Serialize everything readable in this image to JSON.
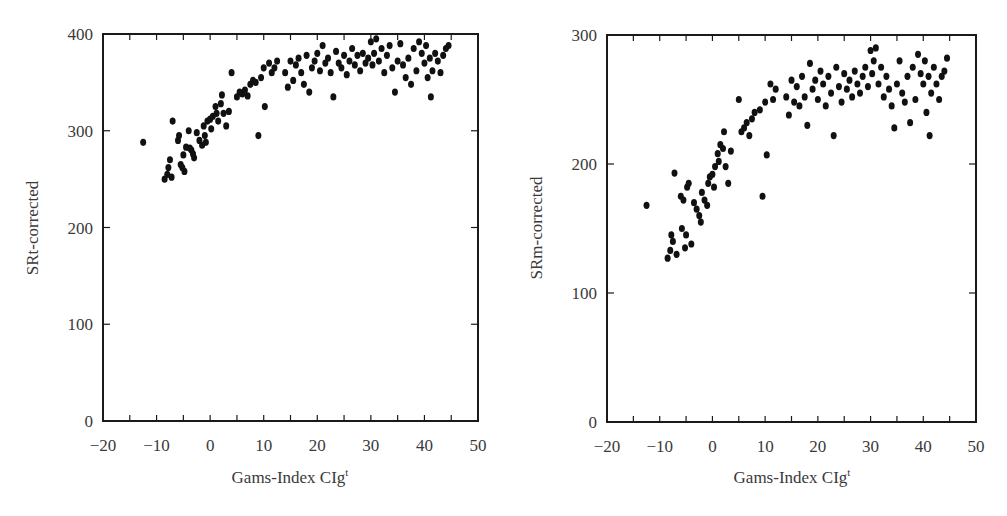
{
  "chart_data": [
    {
      "type": "scatter",
      "title": "",
      "xlabel": "Gams-Index CIg",
      "xlabel_superscript": "t",
      "ylabel": "SRt-corrected",
      "xlim": [
        -20,
        50
      ],
      "ylim": [
        0,
        400
      ],
      "xticks": [
        -20,
        -10,
        0,
        10,
        20,
        30,
        40,
        50
      ],
      "xminor": [
        -15,
        -5,
        5,
        15,
        25,
        35,
        45
      ],
      "yticks": [
        0,
        100,
        200,
        300,
        400
      ],
      "grid": false,
      "legend": null,
      "points": [
        [
          -12.5,
          288
        ],
        [
          -8.5,
          250
        ],
        [
          -8.0,
          255
        ],
        [
          -7.8,
          262
        ],
        [
          -7.5,
          270
        ],
        [
          -7.2,
          252
        ],
        [
          -7.0,
          310
        ],
        [
          -6.0,
          290
        ],
        [
          -5.8,
          295
        ],
        [
          -5.5,
          265
        ],
        [
          -5.2,
          262
        ],
        [
          -5.0,
          275
        ],
        [
          -4.8,
          258
        ],
        [
          -4.5,
          283
        ],
        [
          -4.0,
          300
        ],
        [
          -3.8,
          282
        ],
        [
          -3.5,
          280
        ],
        [
          -3.2,
          276
        ],
        [
          -3.0,
          272
        ],
        [
          -2.5,
          298
        ],
        [
          -2.0,
          290
        ],
        [
          -1.5,
          285
        ],
        [
          -1.2,
          305
        ],
        [
          -1.0,
          295
        ],
        [
          -0.8,
          288
        ],
        [
          -0.5,
          310
        ],
        [
          0.0,
          312
        ],
        [
          0.2,
          302
        ],
        [
          0.5,
          315
        ],
        [
          1.0,
          325
        ],
        [
          1.2,
          318
        ],
        [
          1.5,
          310
        ],
        [
          2.0,
          328
        ],
        [
          2.2,
          337
        ],
        [
          2.5,
          318
        ],
        [
          3.0,
          305
        ],
        [
          3.5,
          320
        ],
        [
          4.0,
          360
        ],
        [
          5.0,
          335
        ],
        [
          5.5,
          340
        ],
        [
          6.0,
          338
        ],
        [
          6.5,
          342
        ],
        [
          7.0,
          336
        ],
        [
          7.5,
          348
        ],
        [
          8.0,
          352
        ],
        [
          8.5,
          350
        ],
        [
          9.0,
          295
        ],
        [
          9.5,
          355
        ],
        [
          10.0,
          365
        ],
        [
          10.2,
          325
        ],
        [
          11.0,
          370
        ],
        [
          11.5,
          360
        ],
        [
          12.0,
          365
        ],
        [
          12.5,
          372
        ],
        [
          14.0,
          360
        ],
        [
          14.5,
          345
        ],
        [
          15.0,
          372
        ],
        [
          15.5,
          352
        ],
        [
          16.0,
          368
        ],
        [
          16.5,
          375
        ],
        [
          17.0,
          360
        ],
        [
          17.5,
          348
        ],
        [
          18.0,
          378
        ],
        [
          18.5,
          340
        ],
        [
          19.0,
          365
        ],
        [
          19.5,
          372
        ],
        [
          20.0,
          380
        ],
        [
          20.5,
          362
        ],
        [
          21.0,
          388
        ],
        [
          21.5,
          370
        ],
        [
          22.0,
          375
        ],
        [
          22.5,
          360
        ],
        [
          23.0,
          335
        ],
        [
          23.5,
          382
        ],
        [
          24.0,
          370
        ],
        [
          24.5,
          365
        ],
        [
          25.0,
          378
        ],
        [
          25.5,
          358
        ],
        [
          26.0,
          372
        ],
        [
          26.5,
          385
        ],
        [
          27.0,
          368
        ],
        [
          27.5,
          378
        ],
        [
          28.0,
          362
        ],
        [
          28.5,
          380
        ],
        [
          29.0,
          370
        ],
        [
          29.5,
          375
        ],
        [
          30.0,
          392
        ],
        [
          30.3,
          368
        ],
        [
          30.6,
          380
        ],
        [
          31.0,
          395
        ],
        [
          31.5,
          372
        ],
        [
          32.0,
          385
        ],
        [
          32.5,
          360
        ],
        [
          33.0,
          378
        ],
        [
          33.5,
          388
        ],
        [
          34.0,
          365
        ],
        [
          34.5,
          340
        ],
        [
          35.0,
          372
        ],
        [
          35.5,
          390
        ],
        [
          36.0,
          368
        ],
        [
          36.5,
          355
        ],
        [
          37.0,
          375
        ],
        [
          37.5,
          348
        ],
        [
          38.0,
          385
        ],
        [
          38.5,
          362
        ],
        [
          39.0,
          392
        ],
        [
          39.5,
          380
        ],
        [
          40.0,
          370
        ],
        [
          40.3,
          388
        ],
        [
          40.6,
          355
        ],
        [
          41.0,
          375
        ],
        [
          41.2,
          335
        ],
        [
          41.5,
          362
        ],
        [
          42.0,
          380
        ],
        [
          42.5,
          372
        ],
        [
          43.0,
          360
        ],
        [
          43.5,
          378
        ],
        [
          44.0,
          385
        ],
        [
          44.5,
          388
        ]
      ]
    },
    {
      "type": "scatter",
      "title": "",
      "xlabel": "Gams-Index CIg",
      "xlabel_superscript": "t",
      "ylabel": "SRm-corrected",
      "xlim": [
        -20,
        50
      ],
      "ylim": [
        0,
        300
      ],
      "xticks": [
        -20,
        -10,
        0,
        10,
        20,
        30,
        40,
        50
      ],
      "xminor": [
        -15,
        -5,
        5,
        15,
        25,
        35,
        45
      ],
      "yticks": [
        0,
        100,
        200,
        300
      ],
      "grid": false,
      "legend": null,
      "points": [
        [
          -12.5,
          168
        ],
        [
          -8.5,
          127
        ],
        [
          -8.0,
          133
        ],
        [
          -7.8,
          145
        ],
        [
          -7.5,
          140
        ],
        [
          -7.2,
          193
        ],
        [
          -6.8,
          130
        ],
        [
          -6.0,
          175
        ],
        [
          -5.8,
          150
        ],
        [
          -5.5,
          172
        ],
        [
          -5.2,
          135
        ],
        [
          -5.0,
          145
        ],
        [
          -4.8,
          182
        ],
        [
          -4.5,
          185
        ],
        [
          -4.0,
          138
        ],
        [
          -3.5,
          170
        ],
        [
          -3.0,
          165
        ],
        [
          -2.5,
          160
        ],
        [
          -2.2,
          155
        ],
        [
          -2.0,
          178
        ],
        [
          -1.5,
          172
        ],
        [
          -1.0,
          168
        ],
        [
          -0.8,
          185
        ],
        [
          -0.5,
          190
        ],
        [
          0.0,
          192
        ],
        [
          0.3,
          182
        ],
        [
          0.5,
          198
        ],
        [
          1.0,
          208
        ],
        [
          1.2,
          202
        ],
        [
          1.5,
          215
        ],
        [
          2.0,
          212
        ],
        [
          2.2,
          225
        ],
        [
          2.5,
          198
        ],
        [
          3.0,
          185
        ],
        [
          3.5,
          210
        ],
        [
          5.0,
          250
        ],
        [
          5.5,
          225
        ],
        [
          6.0,
          228
        ],
        [
          6.5,
          232
        ],
        [
          7.0,
          222
        ],
        [
          7.5,
          235
        ],
        [
          8.0,
          240
        ],
        [
          9.0,
          242
        ],
        [
          9.5,
          175
        ],
        [
          10.0,
          248
        ],
        [
          10.3,
          207
        ],
        [
          11.0,
          262
        ],
        [
          11.5,
          250
        ],
        [
          12.0,
          258
        ],
        [
          14.0,
          252
        ],
        [
          14.5,
          238
        ],
        [
          15.0,
          265
        ],
        [
          15.5,
          248
        ],
        [
          16.0,
          260
        ],
        [
          16.5,
          245
        ],
        [
          17.0,
          268
        ],
        [
          17.5,
          252
        ],
        [
          18.0,
          230
        ],
        [
          18.5,
          278
        ],
        [
          19.0,
          258
        ],
        [
          19.5,
          265
        ],
        [
          20.0,
          250
        ],
        [
          20.5,
          272
        ],
        [
          21.0,
          262
        ],
        [
          21.5,
          245
        ],
        [
          22.0,
          268
        ],
        [
          22.5,
          255
        ],
        [
          23.0,
          222
        ],
        [
          23.5,
          275
        ],
        [
          24.0,
          260
        ],
        [
          24.5,
          248
        ],
        [
          25.0,
          270
        ],
        [
          25.5,
          258
        ],
        [
          26.0,
          265
        ],
        [
          26.5,
          252
        ],
        [
          27.0,
          272
        ],
        [
          27.5,
          262
        ],
        [
          28.0,
          255
        ],
        [
          28.5,
          268
        ],
        [
          29.0,
          275
        ],
        [
          29.5,
          260
        ],
        [
          30.0,
          288
        ],
        [
          30.3,
          270
        ],
        [
          30.6,
          280
        ],
        [
          31.0,
          290
        ],
        [
          31.5,
          262
        ],
        [
          32.0,
          275
        ],
        [
          32.5,
          252
        ],
        [
          33.0,
          268
        ],
        [
          33.5,
          258
        ],
        [
          34.0,
          245
        ],
        [
          34.5,
          228
        ],
        [
          35.0,
          262
        ],
        [
          35.5,
          280
        ],
        [
          36.0,
          255
        ],
        [
          36.5,
          248
        ],
        [
          37.0,
          268
        ],
        [
          37.5,
          232
        ],
        [
          38.0,
          275
        ],
        [
          38.5,
          250
        ],
        [
          39.0,
          285
        ],
        [
          39.5,
          270
        ],
        [
          40.0,
          262
        ],
        [
          40.3,
          280
        ],
        [
          40.6,
          240
        ],
        [
          41.0,
          268
        ],
        [
          41.2,
          222
        ],
        [
          41.5,
          255
        ],
        [
          42.0,
          275
        ],
        [
          42.5,
          262
        ],
        [
          43.0,
          250
        ],
        [
          43.5,
          268
        ],
        [
          44.0,
          272
        ],
        [
          44.5,
          282
        ]
      ]
    }
  ],
  "plots": {
    "left": {
      "ylabel": "SRt-corrected",
      "xlabel": "Gams-Index CIg",
      "xlabel_sup": "t",
      "ytick_labels": [
        "0",
        "100",
        "200",
        "300",
        "400"
      ],
      "xtick_labels": [
        "−20",
        "−10",
        "0",
        "10",
        "20",
        "30",
        "40",
        "50"
      ]
    },
    "right": {
      "ylabel": "SRm-corrected",
      "xlabel": "Gams-Index CIg",
      "xlabel_sup": "t",
      "ytick_labels": [
        "0",
        "100",
        "200",
        "300"
      ],
      "xtick_labels": [
        "−20",
        "−10",
        "0",
        "10",
        "20",
        "30",
        "40",
        "50"
      ]
    }
  },
  "style": {
    "axis_color": "#1a1a1a",
    "point_color": "#111111",
    "text_color": "#3a3a3a"
  }
}
